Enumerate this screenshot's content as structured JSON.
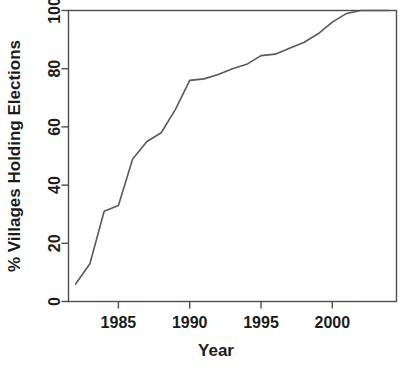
{
  "chart_data": {
    "type": "line",
    "title": "",
    "xlabel": "Year",
    "ylabel": "% Villages Holding Elections",
    "xlim": [
      1981.5,
      2004.5
    ],
    "ylim": [
      0,
      100
    ],
    "xticks": [
      1985,
      1990,
      1995,
      2000
    ],
    "xtick_labels": [
      "1985",
      "1990",
      "1995",
      "2000"
    ],
    "yticks": [
      0,
      20,
      40,
      60,
      80,
      100
    ],
    "ytick_labels": [
      "0",
      "20",
      "40",
      "60",
      "80",
      "100"
    ],
    "grid": false,
    "legend": false,
    "legend_position": "none",
    "line_color": "#595959",
    "series": [
      {
        "name": "% Villages Holding Elections",
        "x": [
          1982,
          1983,
          1984,
          1985,
          1986,
          1987,
          1988,
          1989,
          1990,
          1991,
          1992,
          1993,
          1994,
          1995,
          1996,
          1997,
          1998,
          1999,
          2000,
          2001,
          2002,
          2003,
          2004
        ],
        "values": [
          6,
          13,
          31,
          33,
          49,
          55,
          58,
          66,
          76,
          76.5,
          78,
          80,
          81.5,
          84.5,
          85,
          87,
          89,
          92,
          96,
          99,
          100,
          100,
          100
        ]
      }
    ]
  },
  "axes_labels": {
    "x_axis_title": "Year",
    "y_axis_title": "% Villages Holding Elections"
  }
}
